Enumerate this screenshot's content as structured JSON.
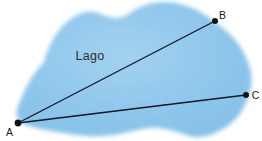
{
  "diagram": {
    "lake_label": "Lago",
    "points": {
      "a": {
        "label": "A"
      },
      "b": {
        "label": "B"
      },
      "c": {
        "label": "C"
      }
    },
    "colors": {
      "lake": "#8cc5eb",
      "lake_light": "#a3d2f0",
      "lake_edge": "#85c0e8",
      "line": "#16162c",
      "dot": "#111111",
      "text": "#1a1a1a",
      "background": "#ffffff"
    }
  }
}
